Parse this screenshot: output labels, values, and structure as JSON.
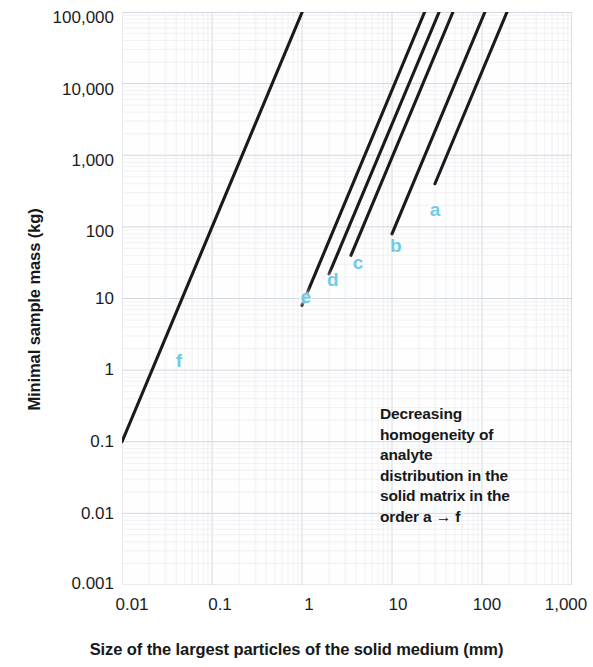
{
  "chart_data": {
    "type": "line",
    "title": "",
    "subtitle": "",
    "xlabel": "Size of the largest particles of the solid medium (mm)",
    "ylabel": "Minimal sample mass (kg)",
    "xscale": "log",
    "yscale": "log",
    "xlim": [
      0.01,
      1000
    ],
    "ylim": [
      0.001,
      100000
    ],
    "xticks": [
      "0.01",
      "0.1",
      "1",
      "10",
      "100",
      "1,000"
    ],
    "xtick_values": [
      0.01,
      0.1,
      1,
      10,
      100,
      1000
    ],
    "yticks": [
      "0.001",
      "0.01",
      "0.1",
      "1",
      "10",
      "100",
      "1,000",
      "10,000",
      "100,000"
    ],
    "ytick_values": [
      0.001,
      0.01,
      0.1,
      1,
      10,
      100,
      1000,
      10000,
      100000
    ],
    "grid": true,
    "grid_style": "graph-paper",
    "legend_position": "inline-curve-labels",
    "annotations": [
      "Decreasing",
      "homogeneity of",
      "analyte",
      "distribution in the",
      "solid matrix in the",
      "order a → f"
    ],
    "series": [
      {
        "name": "a",
        "label": "a",
        "slope": 3,
        "points": [
          [
            30,
            400
          ],
          [
            1000,
            14500000
          ]
        ],
        "x_start": 30,
        "y_start": 400,
        "label_x": 30,
        "label_y": 180
      },
      {
        "name": "b",
        "label": "b",
        "slope": 3,
        "points": [
          [
            10,
            80
          ],
          [
            560,
            14000000
          ]
        ],
        "x_start": 10,
        "y_start": 80,
        "label_x": 11,
        "label_y": 55
      },
      {
        "name": "c",
        "label": "c",
        "slope": 3,
        "points": [
          [
            3.5,
            40
          ],
          [
            300,
            25000000
          ]
        ],
        "x_start": 3.5,
        "y_start": 40,
        "label_x": 4.2,
        "label_y": 32
      },
      {
        "name": "d",
        "label": "d",
        "slope": 3,
        "points": [
          [
            2,
            22
          ],
          [
            170,
            13000000
          ]
        ],
        "x_start": 2,
        "y_start": 22,
        "label_x": 2.2,
        "label_y": 19
      },
      {
        "name": "e",
        "label": "e",
        "slope": 3,
        "points": [
          [
            1,
            8
          ],
          [
            90,
            6000000
          ]
        ],
        "x_start": 1,
        "y_start": 8,
        "label_x": 1.1,
        "label_y": 11
      },
      {
        "name": "f",
        "label": "f",
        "slope": 3,
        "points": [
          [
            0.01,
            0.1
          ],
          [
            3.5,
            4200000
          ]
        ],
        "x_start": 0.01,
        "y_start": 0.1,
        "label_x": 0.043,
        "label_y": 1.4
      }
    ],
    "curve_label_color": "#6ecbe8",
    "line_color": "#1a1a1a",
    "grid_color": "#d9dde3",
    "note": "Six parallel lines of slope 3 on a log-log plot; mass scales with the cube of particle size."
  },
  "axis": {
    "y_title": "Minimal sample mass (kg)",
    "x_title": "Size of the largest particles of the solid medium (mm)"
  }
}
